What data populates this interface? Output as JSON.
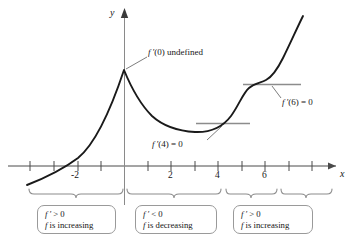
{
  "figure": {
    "type": "calculus-graph",
    "axes": {
      "x_label": "x",
      "y_label": "y",
      "x_ticks_labeled": [
        "-2",
        "2",
        "4",
        "6"
      ],
      "x_ticks_all": [
        -4,
        -3,
        -2,
        -1,
        1,
        2,
        3,
        4,
        5,
        6,
        7,
        8
      ]
    },
    "annotations": [
      {
        "id": "cusp",
        "text": "f ′(0) undefined",
        "points_to": "x=0 cusp"
      },
      {
        "id": "min",
        "text": "f ′(4) = 0",
        "points_to": "x=4 horizontal tangent"
      },
      {
        "id": "infl",
        "text": "f ′(6) = 0",
        "points_to": "x=6 horizontal tangent"
      }
    ],
    "interval_boxes": [
      {
        "line1": "f ′ > 0",
        "line2": "f is increasing"
      },
      {
        "line1": "f ′ < 0",
        "line2": "f is decreasing"
      },
      {
        "line1": "f ′ > 0",
        "line2": "f is increasing"
      }
    ],
    "colors": {
      "curve": "#1a1a1a",
      "axis": "#4a4a4a",
      "tangent": "#8c8c8c",
      "brace": "#8c8c8c",
      "box_border": "#9a9a9a",
      "leader": "#6e6e6e"
    }
  },
  "chart_data": {
    "type": "line",
    "title": "",
    "xlabel": "x",
    "ylabel": "y",
    "xlim": [
      -4.5,
      8.5
    ],
    "ylim": [
      -1.2,
      5.6
    ],
    "grid": false,
    "legend": null,
    "series": [
      {
        "name": "f",
        "x": [
          -4.3,
          -4.0,
          -3.5,
          -3.0,
          -2.5,
          -2.0,
          -1.5,
          -1.0,
          -0.5,
          0.0,
          0.5,
          1.0,
          1.5,
          2.0,
          2.5,
          3.0,
          3.5,
          4.0,
          4.5,
          5.0,
          5.5,
          6.0,
          6.5,
          7.0,
          7.5
        ],
        "y": [
          -0.95,
          -0.72,
          -0.3,
          0.05,
          0.42,
          0.84,
          1.35,
          1.95,
          2.66,
          3.45,
          2.7,
          2.18,
          1.8,
          1.53,
          1.35,
          1.22,
          1.15,
          1.13,
          1.25,
          1.62,
          2.12,
          2.4,
          2.62,
          3.35,
          4.6
        ]
      }
    ],
    "markers": [
      {
        "label": "f ′(0) undefined",
        "x": 0,
        "y": 3.45,
        "kind": "cusp"
      },
      {
        "label": "f ′(4) = 0",
        "x": 4,
        "y": 1.13,
        "kind": "horizontal-tangent"
      },
      {
        "label": "f ′(6) = 0",
        "x": 6,
        "y": 2.4,
        "kind": "horizontal-tangent"
      }
    ],
    "tangent_segments": [
      {
        "at_x": 4,
        "y": 1.13,
        "x_from": 3.0,
        "x_to": 5.1
      },
      {
        "at_x": 6,
        "y": 2.4,
        "x_from": 5.0,
        "x_to": 7.1
      }
    ],
    "intervals": [
      {
        "from": -4.3,
        "to": 0,
        "sign": "f' > 0",
        "behavior": "f is increasing"
      },
      {
        "from": 0,
        "to": 4,
        "sign": "f' < 0",
        "behavior": "f is decreasing"
      },
      {
        "from": 4,
        "to": 6,
        "sign": "f' > 0",
        "behavior": "f is increasing"
      },
      {
        "from": 6,
        "to": 7.5,
        "sign": "f' > 0",
        "behavior": "f is increasing"
      }
    ]
  }
}
